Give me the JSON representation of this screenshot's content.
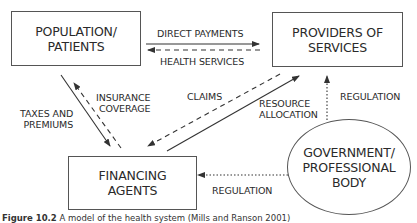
{
  "diagram": {
    "nodes": {
      "population": {
        "label": "POPULATION/\nPATIENTS"
      },
      "providers": {
        "label": "PROVIDERS OF\nSERVICES"
      },
      "financing": {
        "label": "FINANCING\nAGENTS"
      },
      "government": {
        "label": "GOVERNMENT/\nPROFESSIONAL\nBODY"
      }
    },
    "edges": [
      {
        "from": "population",
        "to": "providers",
        "label": "DIRECT PAYMENTS",
        "style": "solid"
      },
      {
        "from": "providers",
        "to": "population",
        "label": "HEALTH SERVICES",
        "style": "dashed"
      },
      {
        "from": "population",
        "to": "financing",
        "label": "TAXES AND\nPREMIUMS",
        "style": "solid"
      },
      {
        "from": "financing",
        "to": "population",
        "label": "INSURANCE\nCOVERAGE",
        "style": "dashed"
      },
      {
        "from": "providers",
        "to": "financing",
        "label": "CLAIMS",
        "style": "dashed"
      },
      {
        "from": "financing",
        "to": "providers",
        "label": "RESOURCE\nALLOCATION",
        "style": "solid"
      },
      {
        "from": "government",
        "to": "providers",
        "label": "REGULATION",
        "style": "dotted"
      },
      {
        "from": "government",
        "to": "financing",
        "label": "REGULATION",
        "style": "dotted"
      }
    ]
  },
  "caption": {
    "figure": "Figure 10.2",
    "text": "A model of the health system (Mills and Ranson 2001)"
  }
}
